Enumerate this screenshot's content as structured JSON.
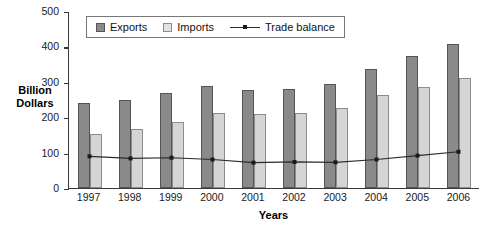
{
  "chart_data": {
    "type": "bar",
    "title": "",
    "xlabel": "Years",
    "ylabel": "Billion Dollars",
    "categories": [
      "1997",
      "1998",
      "1999",
      "2000",
      "2001",
      "2002",
      "2003",
      "2004",
      "2005",
      "2006"
    ],
    "ylim": [
      0,
      500
    ],
    "yticks": [
      0,
      100,
      200,
      300,
      400,
      500
    ],
    "grid": false,
    "legend_position": "top-left",
    "series": [
      {
        "name": "Exports",
        "type": "bar",
        "color": "#8a8a8a",
        "values": [
          240,
          248,
          267,
          288,
          277,
          281,
          293,
          337,
          372,
          408
        ]
      },
      {
        "name": "Imports",
        "type": "bar",
        "color": "#d5d5d5",
        "values": [
          152,
          167,
          186,
          211,
          208,
          213,
          225,
          263,
          284,
          312
        ]
      },
      {
        "name": "Trade balance",
        "type": "line",
        "color": "#2b2b2b",
        "values": [
          90,
          84,
          86,
          81,
          72,
          74,
          73,
          81,
          92,
          103
        ]
      }
    ]
  },
  "legend": {
    "items": [
      {
        "label": "Exports",
        "icon": "square-swatch-dark"
      },
      {
        "label": "Imports",
        "icon": "square-swatch-light"
      },
      {
        "label": "Trade balance",
        "icon": "line-marker"
      }
    ]
  }
}
